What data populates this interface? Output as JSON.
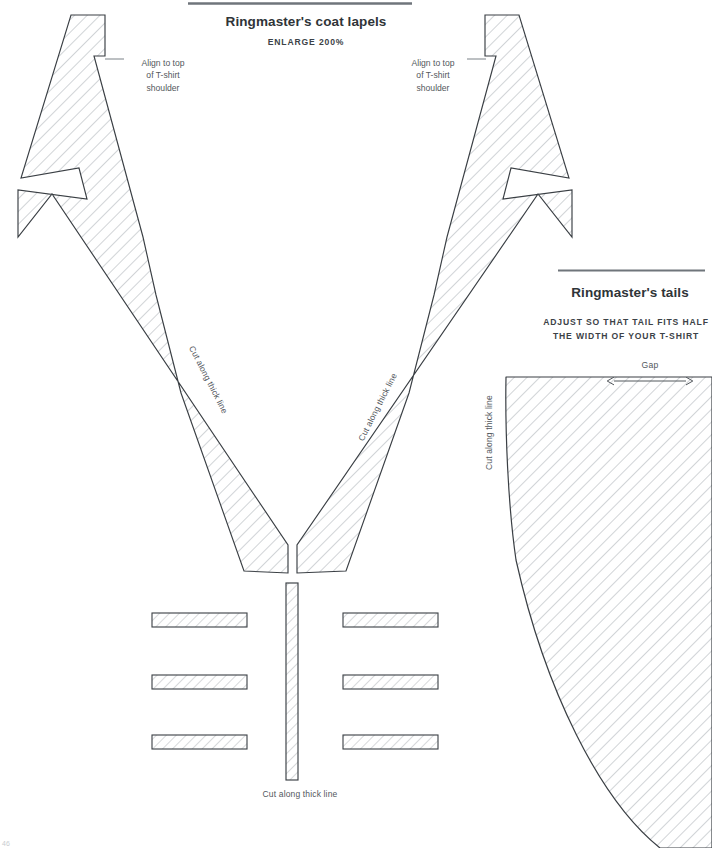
{
  "page": {
    "page_number": "46",
    "background_color": "#ffffff",
    "ink_color": "#4a4f54",
    "outline_color": "#3a3f44",
    "hatch_color": "#9aa0a6"
  },
  "sections": [
    {
      "id": "lapels",
      "title": "Ringmaster's coat lapels",
      "subtitle": "ENLARGE 200%",
      "rule": true
    },
    {
      "id": "tails",
      "title": "Ringmaster's tails",
      "subtitle_line_1": "ADJUST SO THAT TAIL FITS HALF",
      "subtitle_line_2": "THE WIDTH OF YOUR T-SHIRT",
      "rule": true
    }
  ],
  "callouts": {
    "left_lapel": {
      "line_1": "Align to top",
      "line_2": "of T-shirt",
      "line_3": "shoulder"
    },
    "right_lapel": {
      "line_1": "Align to top",
      "line_2": "of T-shirt",
      "line_3": "shoulder"
    }
  },
  "cut_labels": {
    "left_lapel": "Cut along thick line",
    "right_lapel": "Cut along thick line",
    "tails": "Cut along thick line",
    "center_strip": "Cut along thick line"
  },
  "measurements": {
    "gap_label": "Gap"
  },
  "pieces": {
    "left_lapel": {
      "name": "left-lapel",
      "hatched": true
    },
    "right_lapel": {
      "name": "right-lapel",
      "hatched": true
    },
    "center_strip": {
      "name": "center-strip",
      "hatched": true
    },
    "tails": {
      "name": "tails-piece",
      "hatched": true
    },
    "left_bands": {
      "count": 3,
      "hatched": true
    },
    "right_bands": {
      "count": 3,
      "hatched": true
    }
  }
}
